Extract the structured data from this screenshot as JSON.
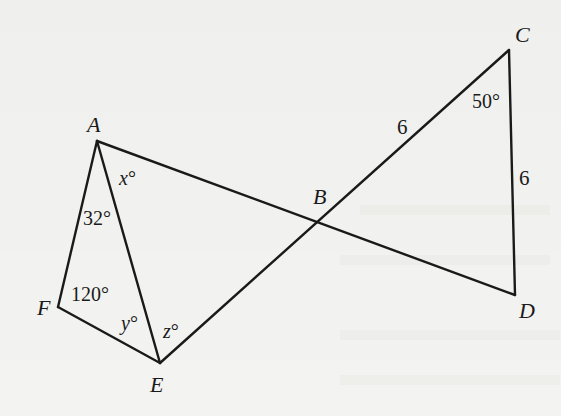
{
  "figure": {
    "vertices": {
      "A": {
        "label": "A",
        "x": 97,
        "y": 141
      },
      "B": {
        "label": "B",
        "x": 319,
        "y": 223
      },
      "C": {
        "label": "C",
        "x": 509,
        "y": 50
      },
      "D": {
        "label": "D",
        "x": 515,
        "y": 295
      },
      "E": {
        "label": "E",
        "x": 160,
        "y": 363
      },
      "F": {
        "label": "F",
        "x": 58,
        "y": 307
      }
    },
    "segments": [
      {
        "name": "segment-af",
        "from": "A",
        "to": "F"
      },
      {
        "name": "segment-fe",
        "from": "F",
        "to": "E"
      },
      {
        "name": "segment-ae",
        "from": "A",
        "to": "E"
      },
      {
        "name": "segment-ad",
        "from": "A",
        "to": "D"
      },
      {
        "name": "segment-ec",
        "from": "E",
        "to": "C"
      },
      {
        "name": "segment-cd",
        "from": "C",
        "to": "D"
      }
    ],
    "angle_labels": {
      "x": {
        "var": "x",
        "unit": "°"
      },
      "y": {
        "var": "y",
        "unit": "°"
      },
      "z": {
        "var": "z",
        "unit": "°"
      },
      "angle_a_in_afe": "32°",
      "angle_f": "120°",
      "angle_c": "50°"
    },
    "side_labels": {
      "bc": "6",
      "cd": "6"
    }
  },
  "colors": {
    "ink": "#1a1a1a",
    "paper": "#f3f3f1"
  }
}
